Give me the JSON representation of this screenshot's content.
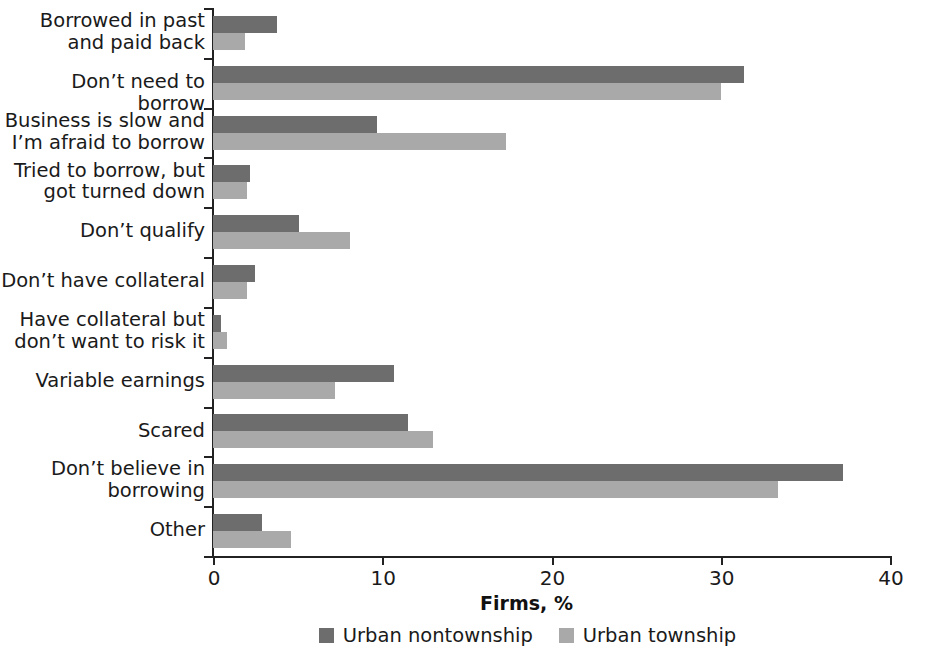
{
  "chart_data": {
    "type": "bar",
    "orientation": "horizontal",
    "title": "",
    "xlabel": "Firms, %",
    "ylabel": "",
    "xlim": [
      0,
      40
    ],
    "xticks": [
      0,
      10,
      20,
      30,
      40
    ],
    "xtick_labels": [
      "0",
      "10",
      "20",
      "30",
      "40"
    ],
    "grid": false,
    "legend_position": "bottom-center",
    "categories": [
      "Borrowed in past and paid back",
      "Don’t need to borrow",
      "Business is slow and I’m afraid to borrow",
      "Tried to borrow, but got turned down",
      "Don’t qualify",
      "Don’t have collateral",
      "Have collateral but don’t want to risk it",
      "Variable earnings",
      "Scared",
      "Don’t believe in borrowing",
      "Other"
    ],
    "category_lines": [
      [
        "Borrowed in past",
        "and paid back"
      ],
      [
        "Don’t need to borrow"
      ],
      [
        "Business is slow and",
        "I’m afraid to borrow"
      ],
      [
        "Tried to borrow, but",
        "got turned down"
      ],
      [
        "Don’t qualify"
      ],
      [
        "Don’t have collateral"
      ],
      [
        "Have collateral but",
        "don’t want to risk it"
      ],
      [
        "Variable earnings"
      ],
      [
        "Scared"
      ],
      [
        "Don’t believe in",
        "borrowing"
      ],
      [
        "Other"
      ]
    ],
    "series": [
      {
        "name": "Urban nontownship",
        "color": "#6d6d6d",
        "values": [
          3.8,
          31.4,
          9.7,
          2.2,
          5.1,
          2.5,
          0.5,
          10.7,
          11.5,
          37.2,
          2.9
        ]
      },
      {
        "name": "Urban township",
        "color": "#a9a9a9",
        "values": [
          1.9,
          30.0,
          17.3,
          2.0,
          8.1,
          2.0,
          0.8,
          7.2,
          13.0,
          33.4,
          4.6
        ]
      }
    ]
  },
  "legend": {
    "items": [
      {
        "label": "Urban nontownship",
        "swatch": "dark"
      },
      {
        "label": "Urban township",
        "swatch": "light"
      }
    ]
  },
  "axis": {
    "x_title": "Firms, %"
  }
}
